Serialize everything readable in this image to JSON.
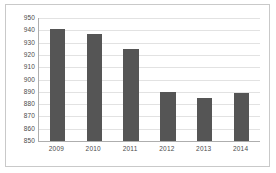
{
  "chart_data": {
    "type": "bar",
    "title": "",
    "subtitle": "",
    "xlabel": "",
    "ylabel": "",
    "categories": [
      "2009",
      "2010",
      "2011",
      "2012",
      "2013",
      "2014"
    ],
    "values": [
      941,
      937,
      925,
      890,
      885,
      889
    ],
    "ylim": [
      850,
      950
    ],
    "ytick_step": 10,
    "yticks": [
      "950",
      "940",
      "930",
      "920",
      "910",
      "900",
      "890",
      "880",
      "870",
      "860",
      "850"
    ],
    "ytick_values": [
      950,
      940,
      930,
      920,
      910,
      900,
      890,
      880,
      870,
      860,
      850
    ],
    "grid": true,
    "grid_axis": "y",
    "legend": false,
    "legend_position": "none",
    "bar_color": "#555555",
    "grid_color": "#e2e2e2",
    "axis_color": "#aeaeae",
    "frame_color": "#c9c9c9",
    "tick_label_color": "#4a4a4a",
    "background_color": "#ffffff",
    "series": [
      {
        "name": "",
        "values": [
          941,
          937,
          925,
          890,
          885,
          889
        ]
      }
    ]
  }
}
